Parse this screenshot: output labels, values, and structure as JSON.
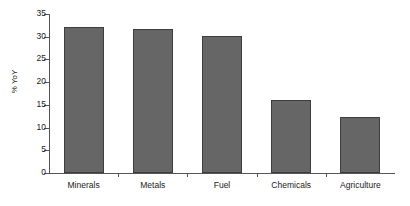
{
  "chart_data": {
    "type": "bar",
    "title": "",
    "xlabel": "",
    "ylabel": "% YoY",
    "categories": [
      "Minerals",
      "Metals",
      "Fuel",
      "Chemicals",
      "Agriculture"
    ],
    "values": [
      32.1,
      31.8,
      30.2,
      16.1,
      12.3
    ],
    "ylim": [
      0,
      35
    ],
    "yticks": [
      0,
      5,
      10,
      15,
      20,
      25,
      30,
      35
    ],
    "ytick_labels": [
      "0",
      "5",
      "10",
      "15",
      "20",
      "25",
      "30",
      "35"
    ],
    "grid": false,
    "legend": false,
    "legend_position": "none",
    "series": [
      {
        "name": "% YoY",
        "values": [
          32.1,
          31.8,
          30.2,
          16.1,
          12.3
        ],
        "color": "#666666"
      }
    ],
    "bar_fill_color": "#666666",
    "bar_edge_color": "#3d3d3d",
    "axis_color": "#555555",
    "background_color": "#ffffff"
  }
}
